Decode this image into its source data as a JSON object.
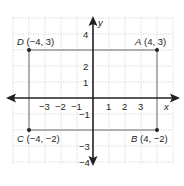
{
  "figure": {
    "type": "coordinate-plane",
    "x_axis_label": "x",
    "y_axis_label": "y",
    "x_tick_labels": [
      "−3",
      "−2",
      "−1",
      "1",
      "2",
      "3"
    ],
    "y_tick_labels": [
      "4",
      "2",
      "1",
      "−1",
      "−3",
      "−4"
    ],
    "points": [
      {
        "name": "D",
        "coords": "(−4, 3)"
      },
      {
        "name": "A",
        "coords": "(4, 3)"
      },
      {
        "name": "C",
        "coords": "(−4, −2)"
      },
      {
        "name": "B",
        "coords": "(4, −2)"
      }
    ],
    "colors": {
      "grid": "#b9b9b9",
      "axes": "#231f20",
      "rectangle": "#8a8a8a",
      "points": "#231f20"
    }
  }
}
